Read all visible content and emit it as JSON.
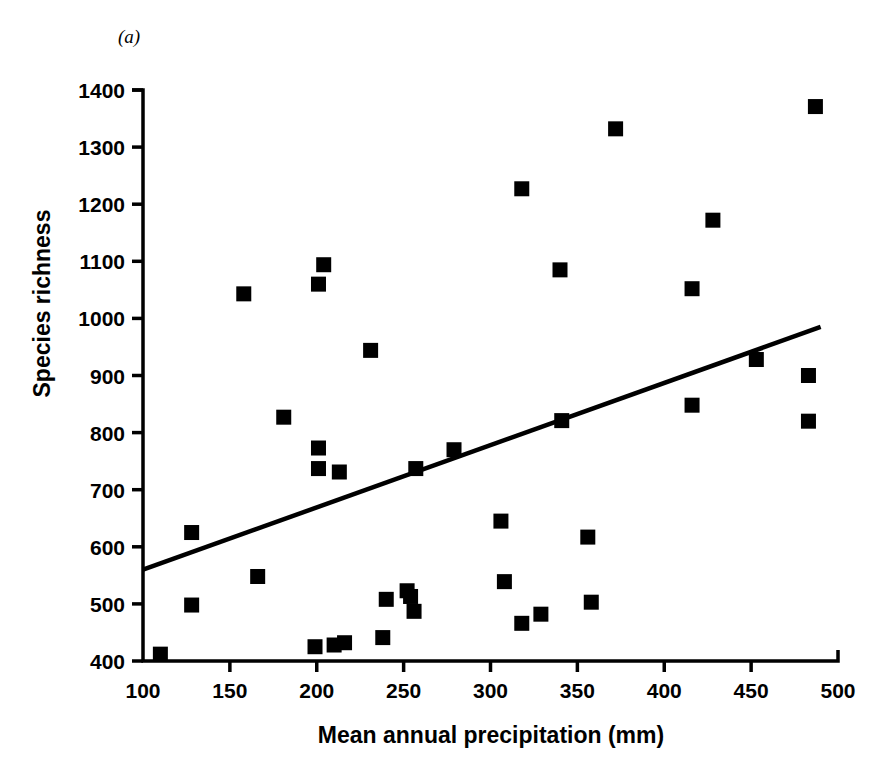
{
  "figure": {
    "panel_label": "(a)",
    "xlabel": "Mean annual precipitation (mm)",
    "ylabel": "Species richness",
    "marker_color": "#000000",
    "line_color": "#000000",
    "axis_color": "#000000",
    "background_color": "#ffffff"
  },
  "chart_data": {
    "type": "scatter",
    "title": "(a)",
    "xlabel": "Mean annual precipitation (mm)",
    "ylabel": "Species richness",
    "xlim": [
      100,
      500
    ],
    "ylim": [
      400,
      1400
    ],
    "xticks": [
      100,
      150,
      200,
      250,
      300,
      350,
      400,
      450,
      500
    ],
    "yticks": [
      400,
      500,
      600,
      700,
      800,
      900,
      1000,
      1100,
      1200,
      1300,
      1400
    ],
    "xtick_labels": [
      "100",
      "150",
      "200",
      "250",
      "300",
      "350",
      "400",
      "450",
      "500"
    ],
    "ytick_labels": [
      "400",
      "500",
      "600",
      "700",
      "800",
      "900",
      "1000",
      "1100",
      "1200",
      "1300",
      "1400"
    ],
    "grid": false,
    "legend": false,
    "marker": "square",
    "points": [
      {
        "x": 110,
        "y": 412
      },
      {
        "x": 128,
        "y": 625
      },
      {
        "x": 128,
        "y": 498
      },
      {
        "x": 158,
        "y": 1043
      },
      {
        "x": 166,
        "y": 548
      },
      {
        "x": 181,
        "y": 827
      },
      {
        "x": 201,
        "y": 1060
      },
      {
        "x": 204,
        "y": 1094
      },
      {
        "x": 201,
        "y": 773
      },
      {
        "x": 201,
        "y": 737
      },
      {
        "x": 213,
        "y": 731
      },
      {
        "x": 199,
        "y": 425
      },
      {
        "x": 210,
        "y": 428
      },
      {
        "x": 216,
        "y": 432
      },
      {
        "x": 231,
        "y": 944
      },
      {
        "x": 238,
        "y": 441
      },
      {
        "x": 240,
        "y": 508
      },
      {
        "x": 252,
        "y": 523
      },
      {
        "x": 254,
        "y": 513
      },
      {
        "x": 256,
        "y": 487
      },
      {
        "x": 257,
        "y": 737
      },
      {
        "x": 279,
        "y": 770
      },
      {
        "x": 306,
        "y": 645
      },
      {
        "x": 308,
        "y": 539
      },
      {
        "x": 318,
        "y": 1227
      },
      {
        "x": 318,
        "y": 466
      },
      {
        "x": 329,
        "y": 482
      },
      {
        "x": 340,
        "y": 1085
      },
      {
        "x": 341,
        "y": 821
      },
      {
        "x": 356,
        "y": 617
      },
      {
        "x": 358,
        "y": 503
      },
      {
        "x": 372,
        "y": 1332
      },
      {
        "x": 416,
        "y": 1052
      },
      {
        "x": 416,
        "y": 848
      },
      {
        "x": 428,
        "y": 1172
      },
      {
        "x": 453,
        "y": 928
      },
      {
        "x": 483,
        "y": 900
      },
      {
        "x": 483,
        "y": 820
      },
      {
        "x": 487,
        "y": 1371
      }
    ],
    "fit_line": {
      "x0": 100,
      "y0": 560,
      "x1": 490,
      "y1": 985,
      "style": "solid"
    }
  }
}
